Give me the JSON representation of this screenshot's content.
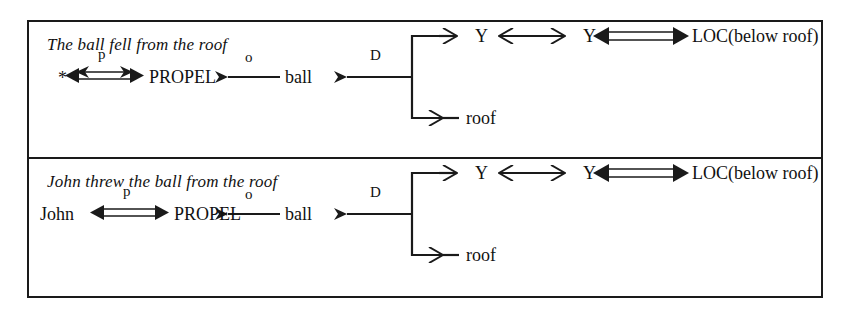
{
  "figure": {
    "kind": "conceptual-dependency-diagram",
    "background_color": "#ffffff",
    "ink_color": "#1a1a1a",
    "border_color": "#1a1a1a"
  },
  "panels": [
    {
      "id": "panel-fell",
      "caption": "The ball fell from the roof",
      "actor": "*",
      "act": "PROPEL",
      "object": "ball",
      "direction_node_1": "Y",
      "direction_node_2": "Y",
      "location": "LOC(below roof)",
      "source": "roof",
      "links": {
        "actor_act": "p",
        "act_object": "o",
        "object_direction": "D"
      }
    },
    {
      "id": "panel-threw",
      "caption": "John threw the ball from the roof",
      "actor": "John",
      "act": "PROPEL",
      "object": "ball",
      "direction_node_1": "Y",
      "direction_node_2": "Y",
      "location": "LOC(below roof)",
      "source": "roof",
      "links": {
        "actor_act": "p",
        "act_object": "o",
        "object_direction": "D"
      }
    }
  ]
}
